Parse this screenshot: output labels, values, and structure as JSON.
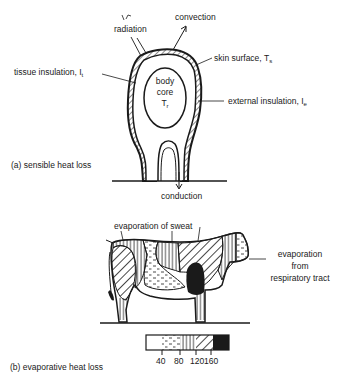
{
  "panel_a": {
    "caption": "(a) sensible heat loss",
    "labels": {
      "radiation": "radiation",
      "convection": "convection",
      "skin_surface": "skin surface, T",
      "skin_surface_sub": "s",
      "tissue_insulation": "tissue insulation, I",
      "tissue_insulation_sub": "t",
      "external_insulation": "external insulation, I",
      "external_insulation_sub": "e",
      "body_core_line1": "body",
      "body_core_line2": "core",
      "body_core_line3": "T",
      "body_core_sub": "r",
      "conduction": "conduction"
    }
  },
  "panel_b": {
    "caption": "(b) evaporative heat loss",
    "labels": {
      "evaporation_sweat": "evaporation of sweat",
      "evaporation_resp_1": "evaporation",
      "evaporation_resp_2": "from",
      "evaporation_resp_3": "respiratory tract"
    },
    "legend": {
      "ticks": [
        "40",
        "80",
        "120",
        "160"
      ],
      "bins": [
        {
          "pattern": "blank",
          "range": "<40"
        },
        {
          "pattern": "dashes",
          "range": "40-80"
        },
        {
          "pattern": "vertical-lines",
          "range": "80-120"
        },
        {
          "pattern": "diagonal-lines",
          "range": "120-160"
        },
        {
          "pattern": "solid",
          "range": ">160"
        }
      ]
    }
  }
}
